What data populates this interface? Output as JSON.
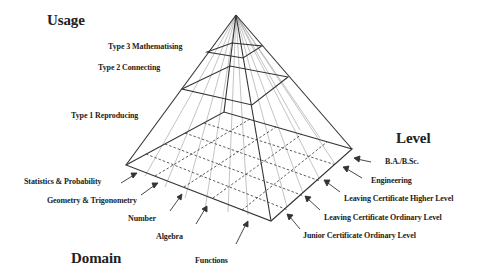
{
  "title_usage": "Usage",
  "title_level": "Level",
  "title_domain": "Domain",
  "usage_levels": [
    "Type 3 Mathematising",
    "Type 2 Connecting",
    "Type 1 Reproducing"
  ],
  "level_items": [
    "B.A./B.Sc.",
    "Engineering",
    "Leaving Certificate Higher Level",
    "Leaving Certificate Ordinary Level",
    "Junior Certificate Ordinary Level"
  ],
  "domain_items": [
    "Statistics & Probability",
    "Geometry & Trigonometry",
    "Number",
    "Algebra",
    "Functions"
  ],
  "colors": {
    "line": "#333333",
    "faint_line": "#999999",
    "text": "#222222"
  }
}
